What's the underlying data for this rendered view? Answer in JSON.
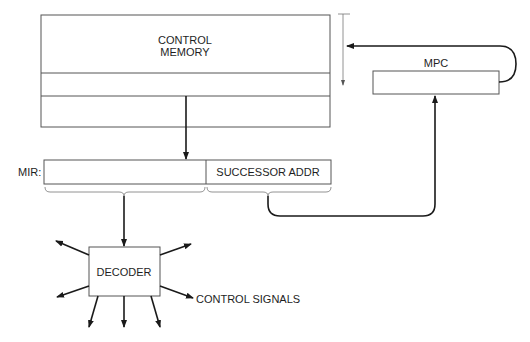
{
  "diagram": {
    "control_memory": {
      "label_line1": "CONTROL",
      "label_line2": "MEMORY"
    },
    "mpc": {
      "label": "MPC"
    },
    "mir": {
      "label": "MIR:",
      "successor_field": "SUCCESSOR ADDR"
    },
    "decoder": {
      "label": "DECODER",
      "output_label": "CONTROL SIGNALS"
    },
    "colors": {
      "stroke": "#555555",
      "text": "#1e1e1e",
      "background": "#ffffff"
    }
  }
}
